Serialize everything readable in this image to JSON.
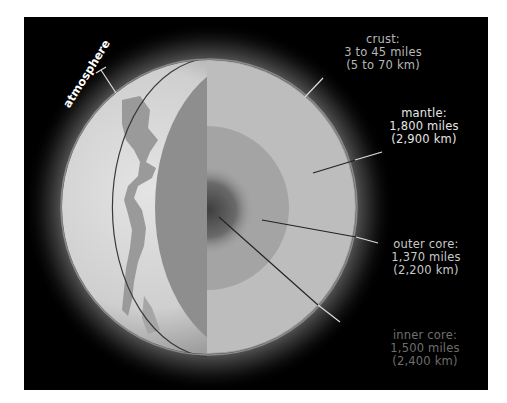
{
  "diagram": {
    "colors": {
      "background": "#000000",
      "surface": "#c9c9c9",
      "land": "#9a9a9a",
      "mantle": "#bdbdbd",
      "outer_core": "#a4a4a4",
      "inner_core": "#5a5a5a",
      "cut_face": "#8e8e8e"
    },
    "labels": {
      "atmosphere": "atmosphere",
      "crust": {
        "name": "crust:",
        "miles": "3 to 45 miles",
        "km": "(5 to 70 km)"
      },
      "mantle": {
        "name": "mantle:",
        "miles": "1,800 miles",
        "km": "(2,900 km)"
      },
      "outer_core": {
        "name": "outer core:",
        "miles": "1,370 miles",
        "km": "(2,200 km)"
      },
      "inner_core": {
        "name": "inner core:",
        "miles": "1,500 miles",
        "km": "(2,400 km)"
      }
    }
  }
}
